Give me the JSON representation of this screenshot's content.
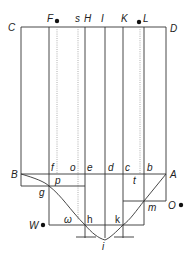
{
  "diagram": {
    "labels": {
      "C": "C",
      "D": "D",
      "F": "F",
      "s": "s",
      "H": "H",
      "I": "I",
      "K": "K",
      "L": "L",
      "B": "B",
      "A": "A",
      "f": "f",
      "o": "o",
      "e": "e",
      "d": "d",
      "c": "c",
      "b": "b",
      "p": "p",
      "t": "t",
      "g": "g",
      "m": "m",
      "O": "O",
      "W": "W",
      "omega": "ω",
      "h": "h",
      "k": "k",
      "i": "i"
    },
    "colors": {
      "line": "#333333",
      "dotted": "#9a9a9a",
      "text": "#222222",
      "background": "#ffffff"
    }
  }
}
